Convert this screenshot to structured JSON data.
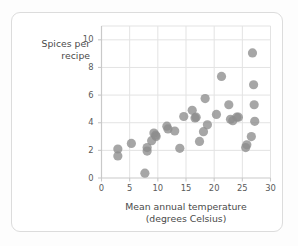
{
  "card": {
    "background": "#ffffff",
    "border_color": "#dcdcdc"
  },
  "chart_data": {
    "type": "scatter",
    "title": "",
    "xlabel": "Mean annual temperature\n(degrees Celsius)",
    "ylabel": "Spices per\nrecipe",
    "xlim": [
      0,
      30
    ],
    "ylim": [
      0,
      11
    ],
    "xticks": [
      0,
      5,
      10,
      15,
      20,
      25,
      30
    ],
    "yticks": [
      0,
      2,
      4,
      6,
      8,
      10
    ],
    "grid": true,
    "grid_color": "#e3e3e3",
    "axis_color": "#c9c9c9",
    "marker_color": "#8d8d8d",
    "marker_size": 4.6,
    "legend": null,
    "points": [
      [
        2.9,
        2.1
      ],
      [
        2.9,
        1.6
      ],
      [
        5.3,
        2.5
      ],
      [
        7.7,
        0.35
      ],
      [
        8.1,
        2.2
      ],
      [
        8.1,
        1.95
      ],
      [
        8.9,
        2.7
      ],
      [
        9.3,
        3.25
      ],
      [
        9.6,
        3.1
      ],
      [
        9.7,
        3.0
      ],
      [
        11.6,
        3.75
      ],
      [
        11.8,
        3.55
      ],
      [
        13.0,
        3.4
      ],
      [
        13.9,
        2.15
      ],
      [
        14.6,
        4.45
      ],
      [
        16.1,
        4.9
      ],
      [
        16.6,
        4.35
      ],
      [
        16.8,
        4.4
      ],
      [
        17.4,
        2.65
      ],
      [
        18.1,
        3.35
      ],
      [
        18.4,
        5.75
      ],
      [
        18.8,
        3.85
      ],
      [
        20.4,
        4.6
      ],
      [
        21.3,
        7.35
      ],
      [
        22.6,
        5.3
      ],
      [
        22.9,
        4.25
      ],
      [
        23.3,
        4.15
      ],
      [
        24.0,
        4.4
      ],
      [
        24.3,
        4.4
      ],
      [
        25.6,
        2.2
      ],
      [
        25.8,
        2.4
      ],
      [
        26.6,
        3.0
      ],
      [
        26.8,
        9.05
      ],
      [
        27.0,
        6.75
      ],
      [
        27.1,
        5.3
      ],
      [
        27.2,
        4.1
      ]
    ]
  }
}
